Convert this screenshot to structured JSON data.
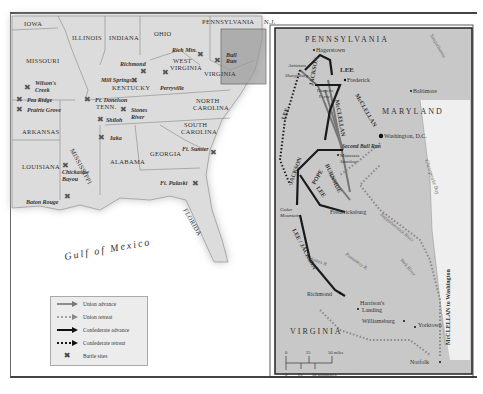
{
  "overview_map": {
    "states": [
      "IOWA",
      "ILLINOIS",
      "INDIANA",
      "OHIO",
      "PENNSYLVANIA",
      "N.J.",
      "DEL.",
      "MISSOURI",
      "KENTUCKY",
      "WEST VIRGINIA",
      "VIRGINIA",
      "TENN.",
      "NORTH CAROLINA",
      "SOUTH CAROLINA",
      "ARKANSAS",
      "MISSISSIPPI",
      "ALABAMA",
      "GEORGIA",
      "LOUISIANA",
      "FLORIDA"
    ],
    "battle_sites": [
      "Wilson's Creek",
      "Pea Ridge",
      "Prairie Grove",
      "Ft. Donelson",
      "Mill Springs",
      "Richmond",
      "Perryville",
      "Stones River",
      "Shiloh",
      "Iuka",
      "Chickasaw Bayou",
      "Baton Rouge",
      "Rich Mtn.",
      "Antietam",
      "Bull Run",
      "Fredericksburg",
      "Seven Days",
      "Ft. Sumter",
      "Ft. Pulaski"
    ],
    "water_label": "Gulf of Mexico"
  },
  "legend": {
    "items": [
      {
        "symbol": "union-advance",
        "label": "Union advance"
      },
      {
        "symbol": "union-retreat",
        "label": "Union retreat"
      },
      {
        "symbol": "confederate-advance",
        "label": "Confederate advance"
      },
      {
        "symbol": "confederate-retreat",
        "label": "Confederate retreat"
      },
      {
        "symbol": "battle-site",
        "label": "Battle sites"
      }
    ]
  },
  "inset_map": {
    "states": [
      "PENNSYLVANIA",
      "MARYLAND",
      "VIRGINIA"
    ],
    "places": [
      "Hagerstown",
      "Antietam",
      "Sharpsburg",
      "Harpers Ferry",
      "Frederick",
      "Baltimore",
      "Washington, D.C.",
      "Second Bull Run",
      "Manassas Junction",
      "Cedar Mountain",
      "Fredericksburg",
      "Richmond",
      "Harrison's Landing",
      "Williamsburg",
      "Yorktown",
      "Norfolk"
    ],
    "commanders": [
      "LEE",
      "McCLELLAN",
      "JACKSON",
      "POPE",
      "BURNSIDE",
      "LEE / JACKSON",
      "McCLELLAN to Washington"
    ],
    "water": [
      "Chesapeake Bay",
      "Potomac River",
      "Rappahannock River",
      "York River",
      "James R.",
      "Pamunkey R.",
      "Susquehanna"
    ],
    "scale": {
      "miles": [
        "0",
        "25",
        "50 miles"
      ],
      "km": [
        "0",
        "25",
        "50 kilometers"
      ]
    }
  },
  "colors": {
    "land": "#d9d9d9",
    "inset_bg": "#c8c8c8",
    "highlight": "#9a9a9a",
    "water": "#ffffff",
    "union": "#888888",
    "confederate": "#222222"
  }
}
